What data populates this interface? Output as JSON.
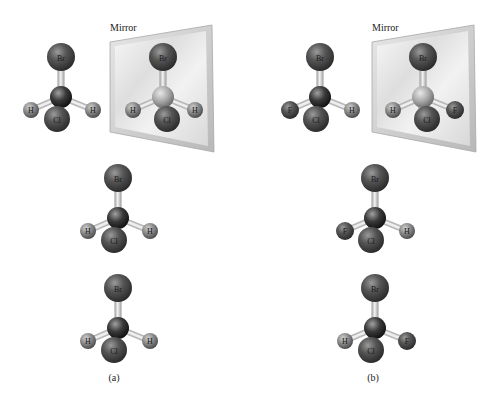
{
  "figure": {
    "panels": [
      {
        "id": "a",
        "caption": "(a)",
        "mirror_label": "Mirror",
        "molecules": [
          {
            "role": "original",
            "top": "Br",
            "center": "C",
            "left": "H",
            "front": "Cl",
            "right": "H"
          },
          {
            "role": "mirror-image",
            "top": "Br",
            "center": "C",
            "left": "H",
            "front": "Cl",
            "right": "H"
          },
          {
            "role": "rotated-1",
            "top": "Br",
            "center": "C",
            "left": "H",
            "front": "Cl",
            "right": "H"
          },
          {
            "role": "rotated-2",
            "top": "Br",
            "center": "C",
            "left": "H",
            "front": "Cl",
            "right": "H"
          }
        ]
      },
      {
        "id": "b",
        "caption": "(b)",
        "mirror_label": "Mirror",
        "molecules": [
          {
            "role": "original",
            "top": "Br",
            "center": "C",
            "left": "F",
            "front": "Cl",
            "right": "H"
          },
          {
            "role": "mirror-image",
            "top": "Br",
            "center": "C",
            "left": "H",
            "front": "Cl",
            "right": "F"
          },
          {
            "role": "rotated-1",
            "top": "Br",
            "center": "C",
            "left": "F",
            "front": "Cl",
            "right": "H"
          },
          {
            "role": "rotated-2",
            "top": "Br",
            "center": "C",
            "left": "H",
            "front": "Cl",
            "right": "F"
          }
        ]
      }
    ],
    "colors": {
      "large_atom": "#5a5a5a",
      "small_atom": "#8a8a8a",
      "carbon": "#3a3a3a",
      "bond": "#d8d8d8",
      "mirror_frame": "#c8c8c8",
      "mirror_glass": "#efefef"
    }
  }
}
